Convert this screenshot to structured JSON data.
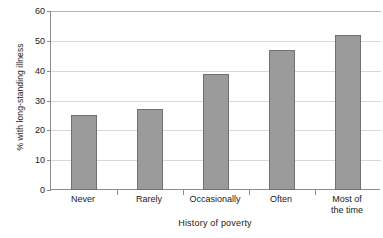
{
  "chart_data": {
    "type": "bar",
    "title": "",
    "categories": [
      "Never",
      "Rarely",
      "Occasionally",
      "Often",
      "Most of\nthe time"
    ],
    "category_lines": [
      [
        "Never"
      ],
      [
        "Rarely"
      ],
      [
        "Occasionally"
      ],
      [
        "Often"
      ],
      [
        "Most of",
        "the time"
      ]
    ],
    "values": [
      25,
      27,
      39,
      47,
      52
    ],
    "xlabel": "History of poverty",
    "ylabel": "% with long-standing illness",
    "ylim": [
      0,
      60
    ],
    "yticks": [
      0,
      10,
      20,
      30,
      40,
      50,
      60
    ],
    "ytick_labels": [
      "0",
      "10",
      "20",
      "30",
      "40",
      "50",
      "60"
    ],
    "grid": "horizontal",
    "legend": "none",
    "bar_color": "#9b9b9b",
    "bar_edge_color": "#717171",
    "axis_color": "#8b8b8b",
    "gridline_color": "#d8d8d8",
    "text_color": "#1a1a1a"
  }
}
